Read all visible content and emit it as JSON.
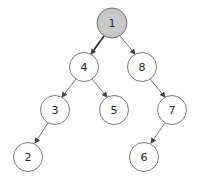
{
  "diagram": {
    "type": "binary-tree",
    "colors": {
      "node_fill": "#ffffff",
      "highlight_fill": "#c8c8c8",
      "stroke": "#555555",
      "edge": "#555555",
      "highlight_edge": "#222222"
    },
    "nodes": [
      {
        "id": "n1",
        "label": "1",
        "cx": 112,
        "cy": 23,
        "highlighted": true
      },
      {
        "id": "n4",
        "label": "4",
        "cx": 84,
        "cy": 67,
        "highlighted": false
      },
      {
        "id": "n8",
        "label": "8",
        "cx": 142,
        "cy": 67,
        "highlighted": false
      },
      {
        "id": "n3",
        "label": "3",
        "cx": 55,
        "cy": 110,
        "highlighted": false
      },
      {
        "id": "n5",
        "label": "5",
        "cx": 114,
        "cy": 110,
        "highlighted": false
      },
      {
        "id": "n7",
        "label": "7",
        "cx": 172,
        "cy": 110,
        "highlighted": false
      },
      {
        "id": "n2",
        "label": "2",
        "cx": 28,
        "cy": 157,
        "highlighted": false
      },
      {
        "id": "n6",
        "label": "6",
        "cx": 144,
        "cy": 157,
        "highlighted": false
      }
    ],
    "edges": [
      {
        "from": "1",
        "to": "4",
        "highlighted": true
      },
      {
        "from": "1",
        "to": "8",
        "highlighted": false
      },
      {
        "from": "4",
        "to": "3",
        "highlighted": false
      },
      {
        "from": "4",
        "to": "5",
        "highlighted": false
      },
      {
        "from": "8",
        "to": "7",
        "highlighted": false
      },
      {
        "from": "3",
        "to": "2",
        "highlighted": false
      },
      {
        "from": "7",
        "to": "6",
        "highlighted": false
      }
    ]
  }
}
